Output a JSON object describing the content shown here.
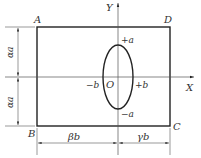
{
  "diagram": {
    "corners": {
      "A": "A",
      "B": "B",
      "C": "C",
      "D": "D"
    },
    "axes": {
      "x_label": "X",
      "y_label": "Y",
      "origin_label": "O"
    },
    "ellipse_labels": {
      "top": "+a",
      "bottom": "−a",
      "left": "−b",
      "right": "+b"
    },
    "dimensions": {
      "left_upper": "αa",
      "left_lower": "αa",
      "bottom_left": "βb",
      "bottom_right": "γb"
    },
    "colors": {
      "line": "#222222",
      "thin_line": "#555555",
      "background": "#ffffff"
    }
  }
}
